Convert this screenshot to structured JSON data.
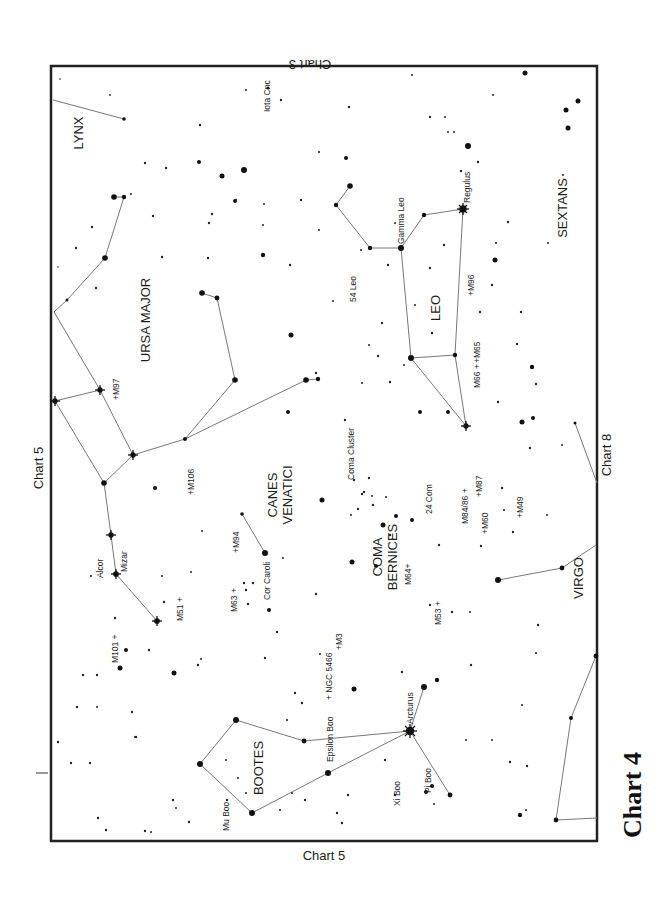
{
  "title": "Chart 4",
  "chart_refs": {
    "top": "Chart 3",
    "left": "Chart 5",
    "bottom": "Chart 5",
    "right": "Chart 8"
  },
  "constellations": [
    {
      "name": "LYNX",
      "x": 78,
      "y": 140
    },
    {
      "name": "URSA MAJOR",
      "x": 152,
      "y": 320
    },
    {
      "name": "CANES",
      "x": 272,
      "y": 495
    },
    {
      "name": "VENATICI",
      "x": 288,
      "y": 495
    },
    {
      "name": "COMA",
      "x": 377,
      "y": 555
    },
    {
      "name": "BERNICES",
      "x": 393,
      "y": 555
    },
    {
      "name": "BOOTES",
      "x": 258,
      "y": 770
    },
    {
      "name": "LEO",
      "x": 435,
      "y": 310
    },
    {
      "name": "SEXTANS",
      "x": 562,
      "y": 210
    },
    {
      "name": "VIRGO",
      "x": 578,
      "y": 578
    }
  ],
  "star_labels": [
    {
      "name": "Iota Cnc",
      "x": 270,
      "y": 110
    },
    {
      "name": "Regulus",
      "x": 470,
      "y": 185
    },
    {
      "name": "Gamma Leo",
      "x": 403,
      "y": 230
    },
    {
      "name": "54 Leo",
      "x": 354,
      "y": 290
    },
    {
      "name": "Alcor",
      "x": 100,
      "y": 565
    },
    {
      "name": "Mizar",
      "x": 125,
      "y": 550
    },
    {
      "name": "Cor Caroli",
      "x": 267,
      "y": 590
    },
    {
      "name": "Coma Cluster",
      "x": 352,
      "y": 460
    },
    {
      "name": "24 Com",
      "x": 431,
      "y": 495
    },
    {
      "name": "Epsilon Boo",
      "x": 330,
      "y": 740
    },
    {
      "name": "Arcturus",
      "x": 412,
      "y": 705
    },
    {
      "name": "Mu Boo",
      "x": 227,
      "y": 800
    },
    {
      "name": "Xi Boo",
      "x": 399,
      "y": 790
    },
    {
      "name": "Pi Boo",
      "x": 430,
      "y": 780
    }
  ],
  "deep_sky_objects": [
    {
      "name": "+M97",
      "x": 117,
      "y": 390
    },
    {
      "name": "+M106",
      "x": 193,
      "y": 480
    },
    {
      "name": "+M94",
      "x": 236,
      "y": 545
    },
    {
      "name": "M63 +",
      "x": 233,
      "y": 598
    },
    {
      "name": "M51 +",
      "x": 181,
      "y": 610
    },
    {
      "name": "M101 +",
      "x": 114,
      "y": 650
    },
    {
      "name": "+ NGC 5466",
      "x": 330,
      "y": 668
    },
    {
      "name": "+M3",
      "x": 340,
      "y": 640
    },
    {
      "name": "M64+",
      "x": 408,
      "y": 568
    },
    {
      "name": "M53 +",
      "x": 438,
      "y": 605
    },
    {
      "name": "M84/86 +",
      "x": 465,
      "y": 495
    },
    {
      "name": "+M87",
      "x": 479,
      "y": 495
    },
    {
      "name": "+M60",
      "x": 485,
      "y": 528
    },
    {
      "name": "+M49",
      "x": 520,
      "y": 505
    },
    {
      "name": "M66 +",
      "x": 478,
      "y": 365
    },
    {
      "name": "+M65",
      "x": 478,
      "y": 335
    },
    {
      "name": "+M96",
      "x": 472,
      "y": 290
    }
  ],
  "colors": {
    "frame": "#222222",
    "lines": "#777777",
    "stars": "#111111",
    "background": "#ffffff"
  }
}
